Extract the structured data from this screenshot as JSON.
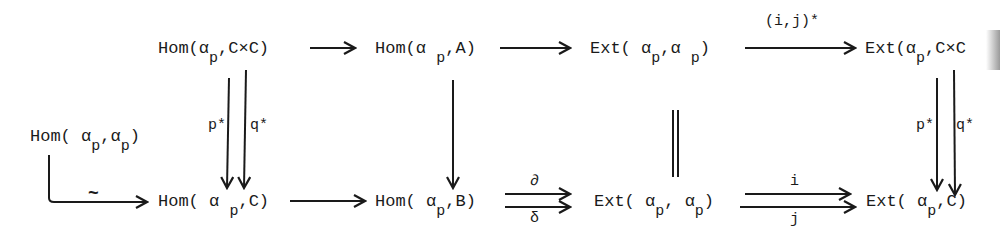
{
  "diagram": {
    "type": "commutative-diagram",
    "nodes": {
      "hom_p_cxc": {
        "pre": "Hom(",
        "alpha": "α",
        "sub": "p",
        "post": ",C×C)"
      },
      "hom_p_a": {
        "pre": "Hom(α",
        "alpha": "",
        "sub": "p",
        "post": ",A)"
      },
      "ext_p_p_top": {
        "pre": "Ext( α",
        "alpha": "",
        "sub": "p",
        "mid": ",α",
        "sub2": "p",
        "post": ")"
      },
      "ext_p_cxc": {
        "pre": "Ext(α",
        "alpha": "",
        "sub": "p",
        "post": ",C×C"
      },
      "hom_p_p_left": {
        "pre": "Hom( α",
        "sub": "p",
        "mid": ",α",
        "sub2": "p",
        "post": ")"
      },
      "hom_p_c": {
        "pre": "Hom( α",
        "sub": "p",
        "post": ",C)"
      },
      "hom_p_b": {
        "pre": "Hom( α",
        "sub": "p",
        "post": ",B)"
      },
      "ext_p_p_bottom": {
        "pre": "Ext( α",
        "sub": "p",
        "mid": ", α",
        "sub2": "p",
        "post": ")"
      },
      "ext_p_c": {
        "pre": "Ext( α",
        "sub": "p",
        "post": ",C)"
      }
    },
    "arrow_labels": {
      "ij_star": "(i,j)*",
      "p_star_left": "p*",
      "q_star_left": "q*",
      "p_star_right": "p*",
      "q_star_right": "q*",
      "tilde": "~",
      "partial": "∂",
      "delta": "δ",
      "i": "i",
      "j": "j"
    },
    "edges": [
      {
        "from": "Hom(αp,C×C)",
        "to": "Hom(αp,A)",
        "label": ""
      },
      {
        "from": "Hom(αp,A)",
        "to": "Ext(αp,αp)",
        "label": ""
      },
      {
        "from": "Ext(αp,αp)",
        "to": "Ext(αp,C×C)",
        "label": "(i,j)*"
      },
      {
        "from": "Hom(αp,C×C)",
        "to": "Hom(αp,C)",
        "label": "p*"
      },
      {
        "from": "Hom(αp,C×C)",
        "to": "Hom(αp,C)",
        "label": "q*"
      },
      {
        "from": "Hom(αp,A)",
        "to": "Hom(αp,B)",
        "label": ""
      },
      {
        "from": "Ext(αp,αp)",
        "to": "Ext(αp,αp)",
        "label": "="
      },
      {
        "from": "Ext(αp,C×C)",
        "to": "Ext(αp,C)",
        "label": "p*"
      },
      {
        "from": "Ext(αp,C×C)",
        "to": "Ext(αp,C)",
        "label": "q*"
      },
      {
        "from": "Hom(αp,αp)",
        "to": "Hom(αp,C)",
        "label": "~"
      },
      {
        "from": "Hom(αp,C)",
        "to": "Hom(αp,B)",
        "label": ""
      },
      {
        "from": "Hom(αp,B)",
        "to": "Ext(αp,αp)",
        "label": "∂"
      },
      {
        "from": "Hom(αp,B)",
        "to": "Ext(αp,αp)",
        "label": "δ"
      },
      {
        "from": "Ext(αp,αp)",
        "to": "Ext(αp,C)",
        "label": "i"
      },
      {
        "from": "Ext(αp,αp)",
        "to": "Ext(αp,C)",
        "label": "j"
      }
    ],
    "colors": {
      "ink": "#1a1a1a",
      "background": "#ffffff"
    }
  }
}
